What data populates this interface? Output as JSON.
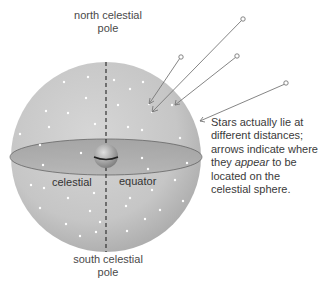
{
  "diagram": {
    "title": "Celestial sphere",
    "labels": {
      "north_pole_line1": "north celestial",
      "north_pole_line2": "pole",
      "south_pole_line1": "south celestial",
      "south_pole_line2": "pole",
      "equator_left": "celestial",
      "equator_right": "equator"
    },
    "caption": {
      "part1": "Stars actually lie at different distances; arrows indicate where they ",
      "emphasis": "appear",
      "part2": " to be located on the celestial sphere."
    },
    "colors": {
      "sphere": "#c8c8c8",
      "sphere_shadow": "#a9a9a9",
      "equator_plane": "#a8a8a8",
      "axis": "#333333",
      "arrow": "#777777",
      "star": "#ffffff",
      "text": "#3a3a3a"
    },
    "sphere": {
      "cx": 106,
      "cy": 157,
      "r": 95
    },
    "arrows": [
      {
        "from": [
          180,
          58
        ],
        "to": [
          149,
          104
        ]
      },
      {
        "from": [
          242,
          20
        ],
        "to": [
          152,
          112
        ]
      },
      {
        "from": [
          236,
          57
        ],
        "to": [
          175,
          105
        ]
      },
      {
        "from": [
          285,
          84
        ],
        "to": [
          200,
          121
        ]
      }
    ]
  }
}
